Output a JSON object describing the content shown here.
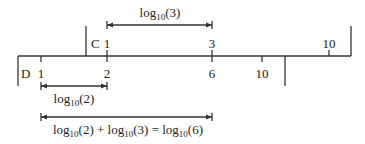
{
  "diagram": {
    "scale_c": {
      "label": "C",
      "ticks": [
        {
          "value": "1",
          "x": 107
        },
        {
          "value": "3",
          "x": 212
        },
        {
          "value": "10",
          "x": 329
        }
      ]
    },
    "scale_d": {
      "label": "D",
      "ticks": [
        {
          "value": "1",
          "x": 41
        },
        {
          "value": "2",
          "x": 107
        },
        {
          "value": "6",
          "x": 212
        },
        {
          "value": "10",
          "x": 262
        }
      ]
    },
    "arrows": {
      "top": {
        "base": "log",
        "sub": "10",
        "arg": "(3)"
      },
      "middle": {
        "base": "log",
        "sub": "10",
        "arg": "(2)"
      },
      "bottom": {
        "p1": "log",
        "s1": "10",
        "a1": "(2) + ",
        "p2": "log",
        "s2": "10",
        "a2": "(3) = ",
        "p3": "log",
        "s3": "10",
        "a3": "(6)"
      }
    }
  }
}
